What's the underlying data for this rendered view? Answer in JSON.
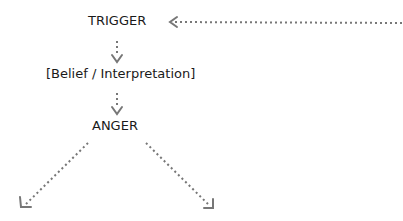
{
  "diagram": {
    "nodes": {
      "trigger": "TRIGGER",
      "belief": "[Belief / Interpretation]",
      "anger": "ANGER"
    },
    "arrow_color": "#777777",
    "text_color": "#1a1a1a",
    "edges": [
      {
        "from": "right-edge",
        "to": "trigger",
        "style": "dotted"
      },
      {
        "from": "trigger",
        "to": "belief",
        "style": "dotted"
      },
      {
        "from": "belief",
        "to": "anger",
        "style": "dotted"
      },
      {
        "from": "anger",
        "to": "bottom-left",
        "style": "dotted"
      },
      {
        "from": "anger",
        "to": "bottom-right",
        "style": "dotted"
      }
    ]
  }
}
